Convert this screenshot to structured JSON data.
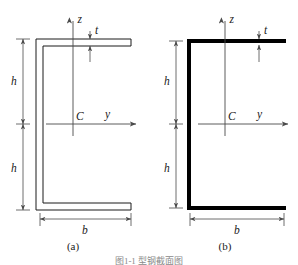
{
  "figure": {
    "caption": "图1-1  型钢截面图",
    "panels": [
      {
        "id": "a",
        "sub_label": "(a)",
        "style": "double-line-wall",
        "labels": {
          "axis_z": "z",
          "axis_y": "y",
          "centroid": "C",
          "thickness": "t",
          "height_upper": "h",
          "height_lower": "h",
          "width": "b"
        }
      },
      {
        "id": "b",
        "sub_label": "(b)",
        "style": "thick-centerline",
        "labels": {
          "axis_z": "z",
          "axis_y": "y",
          "centroid": "C",
          "thickness": "t",
          "height_upper": "h",
          "height_lower": "h",
          "width": "b"
        }
      }
    ]
  },
  "colors": {
    "outline": "#1a1a1a",
    "thick_outline": "#000000",
    "axis": "#4a4a4a",
    "dimension": "#4a4a4a",
    "background": "#ffffff",
    "caption": "#8a8a8a"
  }
}
